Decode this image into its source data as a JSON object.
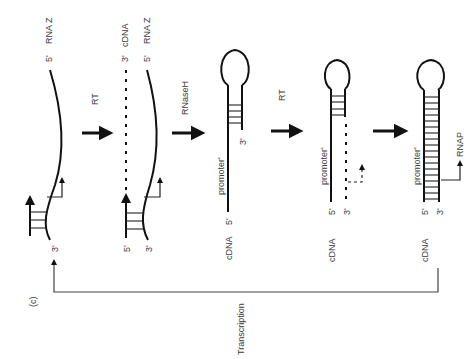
{
  "figure": {
    "panel_label": "(c)",
    "cycle_label": "Transcription"
  },
  "steps": [
    {
      "id": "step1",
      "top_labels": {
        "five_prime": "5'",
        "strand": "RNA Z"
      },
      "bottom_labels": {
        "three_prime": "3'"
      }
    },
    {
      "id": "step2",
      "top_labels": {
        "cdna_three": "3'",
        "cdna": "cDNA",
        "rna_five": "5'",
        "rna": "RNA Z"
      },
      "bottom_labels": {
        "five_prime": "5'",
        "three_prime": "3'"
      }
    },
    {
      "id": "step3",
      "labels": {
        "three_prime": "3'",
        "promoter": "promoter'",
        "five_prime": "5'",
        "strand": "cDNA"
      }
    },
    {
      "id": "step4",
      "labels": {
        "promoter": "promoter'",
        "five_prime": "5'",
        "three_prime": "3'",
        "strand": "cDNA"
      }
    },
    {
      "id": "step5",
      "labels": {
        "promoter": "promoter'",
        "five_prime": "5'",
        "three_prime": "3'",
        "strand": "cDNA",
        "enzyme": "RNAP"
      }
    }
  ],
  "arrows": [
    {
      "id": "arrow1",
      "label": "RT"
    },
    {
      "id": "arrow2",
      "label": "RNaseH"
    },
    {
      "id": "arrow3",
      "label": "RT"
    },
    {
      "id": "arrow4",
      "label": ""
    }
  ]
}
